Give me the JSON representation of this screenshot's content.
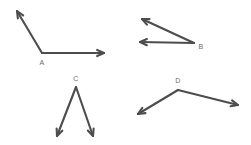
{
  "canvas": {
    "width": 251,
    "height": 145,
    "background_color": "#ffffff",
    "stroke_color": "#4d4d4d",
    "label_color": "#6b6b6b",
    "stroke_width": 2.1
  },
  "figures": [
    {
      "id": "angle-a",
      "label": "A",
      "label_position": {
        "x": 42,
        "y": 62
      },
      "vertex": {
        "x": 42,
        "y": 53
      },
      "rays": [
        {
          "id": "ray-a-upper-left",
          "to": {
            "x": 17,
            "y": 11
          },
          "arrow": true
        },
        {
          "id": "ray-a-right",
          "to": {
            "x": 104,
            "y": 53
          },
          "arrow": true
        }
      ]
    },
    {
      "id": "angle-b",
      "label": "B",
      "label_position": {
        "x": 201,
        "y": 46
      },
      "vertex": {
        "x": 194,
        "y": 43
      },
      "rays": [
        {
          "id": "ray-b-upper-left",
          "to": {
            "x": 142,
            "y": 19
          },
          "arrow": true
        },
        {
          "id": "ray-b-left",
          "to": {
            "x": 140,
            "y": 42
          },
          "arrow": true
        }
      ]
    },
    {
      "id": "angle-c",
      "label": "C",
      "label_position": {
        "x": 76,
        "y": 78
      },
      "vertex": {
        "x": 76,
        "y": 87
      },
      "rays": [
        {
          "id": "ray-c-lower-left",
          "to": {
            "x": 57,
            "y": 136
          },
          "arrow": true
        },
        {
          "id": "ray-c-lower-right",
          "to": {
            "x": 93,
            "y": 136
          },
          "arrow": true
        }
      ]
    },
    {
      "id": "angle-d",
      "label": "D",
      "label_position": {
        "x": 178,
        "y": 80
      },
      "vertex": {
        "x": 178,
        "y": 90
      },
      "rays": [
        {
          "id": "ray-d-lower-left",
          "to": {
            "x": 138,
            "y": 114
          },
          "arrow": true
        },
        {
          "id": "ray-d-lower-right",
          "to": {
            "x": 238,
            "y": 105
          },
          "arrow": true
        }
      ]
    }
  ]
}
